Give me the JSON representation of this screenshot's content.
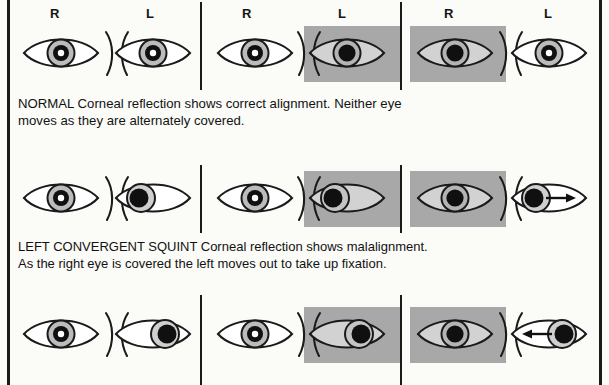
{
  "figure": {
    "type": "clinical-illustration",
    "colors": {
      "ink": "#1a1a1a",
      "occluder_gray": "#a8a8a8",
      "iris_gray": "#b9b9b9",
      "pupil_black": "#101010",
      "page": "#fbfbf8"
    }
  },
  "columns": {
    "labels": [
      "R",
      "L"
    ],
    "count": 3,
    "description": [
      "uncovered both eyes",
      "left eye covered",
      "right eye covered"
    ]
  },
  "rows": [
    {
      "id": "normal",
      "label_r": "R",
      "label_l": "L",
      "panels": [
        {
          "cover": "none",
          "right_eye": {
            "gaze": "center",
            "reflection": true,
            "arrow": "none",
            "covered": false
          },
          "left_eye": {
            "gaze": "center",
            "reflection": true,
            "arrow": "none",
            "covered": false
          }
        },
        {
          "cover": "left",
          "right_eye": {
            "gaze": "center",
            "reflection": true,
            "arrow": "none",
            "covered": false
          },
          "left_eye": {
            "gaze": "center",
            "reflection": false,
            "arrow": "none",
            "covered": true
          }
        },
        {
          "cover": "right",
          "right_eye": {
            "gaze": "center",
            "reflection": false,
            "arrow": "none",
            "covered": true
          },
          "left_eye": {
            "gaze": "center",
            "reflection": true,
            "arrow": "none",
            "covered": false
          }
        }
      ],
      "caption": {
        "term": "NORMAL",
        "line1": "NORMAL  Corneal reflection shows correct alignment. Neither eye",
        "line2": "moves as they are alternately covered."
      }
    },
    {
      "id": "left-convergent-squint",
      "label_r": "R",
      "label_l": "L",
      "panels": [
        {
          "cover": "none",
          "right_eye": {
            "gaze": "center",
            "reflection": true,
            "arrow": "none",
            "covered": false
          },
          "left_eye": {
            "gaze": "nasal-in",
            "reflection": false,
            "arrow": "none",
            "covered": false
          }
        },
        {
          "cover": "left",
          "right_eye": {
            "gaze": "center",
            "reflection": true,
            "arrow": "none",
            "covered": false
          },
          "left_eye": {
            "gaze": "nasal-in",
            "reflection": false,
            "arrow": "none",
            "covered": true
          }
        },
        {
          "cover": "right",
          "right_eye": {
            "gaze": "center",
            "reflection": false,
            "arrow": "none",
            "covered": true
          },
          "left_eye": {
            "gaze": "nasal-in",
            "reflection": false,
            "arrow": "out-right",
            "covered": false
          }
        }
      ],
      "caption": {
        "term": "LEFT CONVERGENT SQUINT",
        "line1": "LEFT CONVERGENT SQUINT  Corneal reflection shows malalignment.",
        "line2": "As the right eye is covered the left moves out to take up fixation."
      }
    },
    {
      "id": "left-divergent-squint",
      "label_r": "",
      "label_l": "",
      "panels": [
        {
          "cover": "none",
          "right_eye": {
            "gaze": "center",
            "reflection": true,
            "arrow": "none",
            "covered": false
          },
          "left_eye": {
            "gaze": "temporal-out",
            "reflection": false,
            "arrow": "none",
            "covered": false
          }
        },
        {
          "cover": "left",
          "right_eye": {
            "gaze": "center",
            "reflection": true,
            "arrow": "none",
            "covered": false
          },
          "left_eye": {
            "gaze": "temporal-out",
            "reflection": false,
            "arrow": "none",
            "covered": true
          }
        },
        {
          "cover": "right",
          "right_eye": {
            "gaze": "center",
            "reflection": false,
            "arrow": "none",
            "covered": true
          },
          "left_eye": {
            "gaze": "temporal-out",
            "reflection": false,
            "arrow": "in-left",
            "covered": false
          }
        }
      ],
      "caption": {
        "term": "",
        "line1": "",
        "line2": ""
      }
    }
  ],
  "icons": {
    "eye": "eye-icon",
    "occluder": "cover-paddle-icon",
    "arrow_out": "arrow-right-icon",
    "arrow_in": "arrow-left-icon",
    "nose_bridge": "nose-bridge-icon"
  }
}
